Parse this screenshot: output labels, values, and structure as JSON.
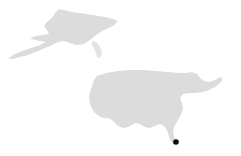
{
  "map": {
    "title": "United States locator map",
    "projection_note": "Albers-like conic with Alaska inset",
    "width": 241,
    "height": 156,
    "background_color": "#ffffff",
    "land_fill_color": "#dcdcdc",
    "marker_color": "#0a0a0a",
    "regions": [
      {
        "name": "alaska",
        "label": "Alaska",
        "inset": true,
        "fill": "#dcdcdc",
        "path": "M 59 9 L 72 12 L 86 14 L 99 16 L 110 18 L 118 21 L 113 26 L 104 30 L 96 35 L 90 40 L 84 44 L 77 45 L 70 43 L 64 41 L 58 42 L 52 45 L 45 48 L 38 51 L 30 54 L 22 56 L 14 58 L 8 59 L 13 55 L 22 51 L 31 48 L 40 45 L 46 42 L 41 41 L 35 40 L 30 38 L 36 36 L 43 35 L 49 34 L 47 30 L 44 26 L 47 22 L 52 18 L 55 13 Z"
      },
      {
        "name": "alaska-aleutians",
        "label": "Aleutian Islands",
        "inset": true,
        "fill": "#dcdcdc",
        "path": "M 8 59 L 16 57 L 24 55 L 33 53 L 41 50 L 36 52 L 28 55 L 20 57 L 12 59 Z"
      },
      {
        "name": "alaska-panhandle",
        "label": "Alaska Panhandle",
        "inset": true,
        "fill": "#e4e4e4",
        "path": "M 92 41 L 96 42 L 99 45 L 101 49 L 102 54 L 100 58 L 97 57 L 96 53 L 94 49 L 92 45 Z"
      },
      {
        "name": "contiguous-us",
        "label": "Contiguous United States",
        "inset": false,
        "fill": "#dcdcdc",
        "path": "M 97 76 L 106 73 L 118 71 L 131 70 L 144 70 L 156 71 L 168 72 L 178 73 L 186 73 L 192 72 L 197 74 L 200 78 L 204 81 L 209 82 L 215 80 L 220 77 L 223 79 L 220 83 L 215 87 L 209 90 L 203 92 L 196 93 L 189 93 L 183 94 L 180 98 L 182 103 L 183 109 L 181 115 L 178 120 L 175 125 L 173 131 L 174 137 L 176 142 L 174 145 L 171 142 L 169 136 L 167 130 L 164 126 L 160 124 L 155 126 L 150 128 L 145 127 L 140 124 L 135 123 L 130 126 L 125 128 L 120 127 L 116 124 L 112 120 L 108 118 L 103 118 L 99 116 L 95 113 L 92 109 L 90 104 L 89 98 L 90 92 L 92 86 L 94 80 Z"
      }
    ],
    "markers": [
      {
        "name": "data-point-florida",
        "label": "",
        "x": 176,
        "y": 142,
        "radius": 2.8,
        "shape": "circle",
        "color": "#0a0a0a"
      }
    ]
  }
}
